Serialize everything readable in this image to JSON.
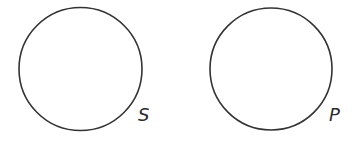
{
  "diagram": {
    "shapes": [
      {
        "id": "circle-s",
        "type": "circle",
        "cx": 80.5,
        "cy": 69,
        "r": 61.5,
        "stroke": "#333333",
        "fill": "none",
        "label": "S"
      },
      {
        "id": "circle-p",
        "type": "circle",
        "cx": 271,
        "cy": 69,
        "r": 61,
        "stroke": "#333333",
        "fill": "none",
        "label": "P"
      }
    ],
    "labels": {
      "s": "S",
      "p": "P"
    },
    "colors": {
      "stroke": "#333333",
      "text": "#2a2a2a",
      "background": "#ffffff"
    }
  }
}
